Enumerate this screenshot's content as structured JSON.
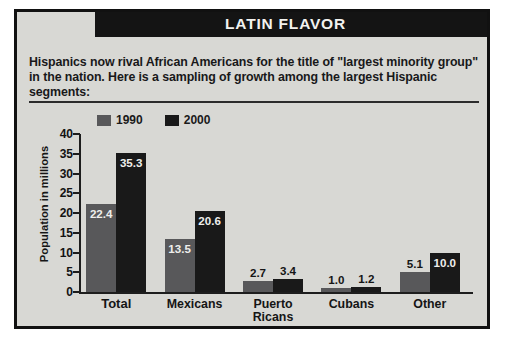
{
  "header": {
    "title": "LATIN FLAVOR"
  },
  "intro": {
    "text": "Hispanics now rival African Americans for the title of \"largest minority group\" in the nation. Here is a sampling of growth among the largest Hispanic segments:"
  },
  "legend": {
    "items": [
      {
        "label": "1990",
        "color": "#58585a",
        "swatch_name": "legend-swatch-1990"
      },
      {
        "label": "2000",
        "color": "#191919",
        "swatch_name": "legend-swatch-2000"
      }
    ]
  },
  "chart_data": {
    "type": "bar",
    "title": "LATIN FLAVOR",
    "xlabel": "",
    "ylabel": "Population in millions",
    "ylim": [
      0,
      40
    ],
    "yticks": [
      0,
      5,
      10,
      15,
      20,
      25,
      30,
      35,
      40
    ],
    "ytick_labels": [
      "0",
      "5",
      "10",
      "15",
      "20",
      "25",
      "30",
      "35",
      "40"
    ],
    "grid": false,
    "legend_position": "top-left",
    "categories": [
      "Total",
      "Mexicans",
      "Puerto Ricans",
      "Cubans",
      "Other"
    ],
    "series": [
      {
        "name": "1990",
        "color": "#58585a",
        "values": [
          22.4,
          13.5,
          2.7,
          1.0,
          5.1
        ],
        "value_labels": [
          "22.4",
          "13.5",
          "2.7",
          "1.0",
          "5.1"
        ]
      },
      {
        "name": "2000",
        "color": "#191919",
        "values": [
          35.3,
          20.6,
          3.4,
          1.2,
          10.0
        ],
        "value_labels": [
          "35.3",
          "20.6",
          "3.4",
          "1.2",
          "10.0"
        ]
      }
    ]
  },
  "xaxis": {
    "labels": [
      {
        "line1": "Total",
        "line2": ""
      },
      {
        "line1": "Mexicans",
        "line2": ""
      },
      {
        "line1": "Puerto",
        "line2": "Ricans"
      },
      {
        "line1": "Cubans",
        "line2": ""
      },
      {
        "line1": "Other",
        "line2": ""
      }
    ]
  }
}
